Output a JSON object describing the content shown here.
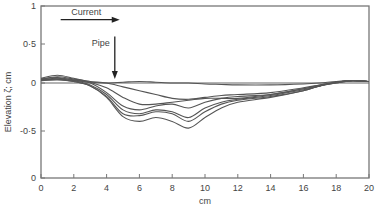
{
  "chart_data": {
    "type": "line",
    "title": "",
    "xlabel": "cm",
    "ylabel": "Elevation ζ; cm",
    "xlim": [
      0,
      20
    ],
    "ylim": [
      -1,
      1
    ],
    "grid": false,
    "legend": null,
    "x_ticks": [
      0,
      2,
      4,
      6,
      8,
      10,
      12,
      14,
      16,
      18,
      20
    ],
    "x_tick_labels": [
      "0",
      "2",
      "4",
      "6",
      "8",
      "10",
      "12",
      "14",
      "16",
      "18",
      "20"
    ],
    "y_ticks": [
      1,
      0.5,
      0,
      -0.5,
      -1
    ],
    "y_tick_labels": [
      "1",
      "0·5",
      "0",
      "-0·5",
      "0"
    ],
    "reference_line_y": 0,
    "annotations": [
      {
        "text": "Current",
        "type": "arrow-right",
        "x_start": 1.2,
        "x_end": 4.8,
        "y": 0.82
      },
      {
        "text": "Pipe",
        "type": "arrow-down",
        "x": 4.5,
        "y_start": 0.6,
        "y_end": 0.05
      }
    ],
    "x": [
      0,
      1,
      2,
      3,
      4,
      5,
      6,
      7,
      8,
      9,
      10,
      11,
      12,
      14,
      16,
      17,
      18,
      19,
      20
    ],
    "series": [
      {
        "name": "profile-1",
        "values": [
          0.04,
          0.05,
          0.03,
          0.01,
          0.0,
          0.01,
          0.02,
          0.01,
          0.0,
          0.0,
          -0.01,
          -0.015,
          -0.02,
          -0.02,
          -0.01,
          0.0,
          0.02,
          0.03,
          0.02
        ]
      },
      {
        "name": "profile-2",
        "values": [
          0.05,
          0.08,
          0.05,
          0.02,
          0.0,
          -0.04,
          -0.08,
          -0.12,
          -0.16,
          -0.17,
          -0.15,
          -0.13,
          -0.12,
          -0.1,
          -0.05,
          -0.02,
          0.01,
          0.03,
          0.02
        ]
      },
      {
        "name": "profile-3",
        "values": [
          0.06,
          0.1,
          0.06,
          0.01,
          -0.05,
          -0.15,
          -0.22,
          -0.22,
          -0.2,
          -0.18,
          -0.16,
          -0.16,
          -0.16,
          -0.12,
          -0.06,
          -0.03,
          0.01,
          0.03,
          0.02
        ]
      },
      {
        "name": "profile-4",
        "values": [
          0.04,
          0.06,
          0.04,
          0.0,
          -0.1,
          -0.24,
          -0.28,
          -0.24,
          -0.22,
          -0.26,
          -0.2,
          -0.16,
          -0.14,
          -0.12,
          -0.06,
          -0.02,
          0.01,
          0.03,
          0.02
        ]
      },
      {
        "name": "profile-5",
        "values": [
          0.05,
          0.07,
          0.03,
          -0.02,
          -0.12,
          -0.28,
          -0.32,
          -0.28,
          -0.3,
          -0.36,
          -0.26,
          -0.2,
          -0.17,
          -0.13,
          -0.07,
          -0.03,
          0.01,
          0.03,
          0.02
        ]
      },
      {
        "name": "profile-6",
        "values": [
          0.04,
          0.05,
          0.02,
          -0.03,
          -0.14,
          -0.32,
          -0.34,
          -0.3,
          -0.32,
          -0.4,
          -0.3,
          -0.22,
          -0.18,
          -0.14,
          -0.08,
          -0.03,
          0.0,
          0.03,
          0.02
        ]
      },
      {
        "name": "profile-7",
        "values": [
          0.03,
          0.04,
          0.02,
          -0.03,
          -0.15,
          -0.35,
          -0.4,
          -0.36,
          -0.4,
          -0.47,
          -0.36,
          -0.26,
          -0.2,
          -0.15,
          -0.08,
          -0.03,
          0.0,
          0.03,
          0.02
        ]
      }
    ],
    "line_color": "#555555",
    "axis_color": "#777777"
  }
}
